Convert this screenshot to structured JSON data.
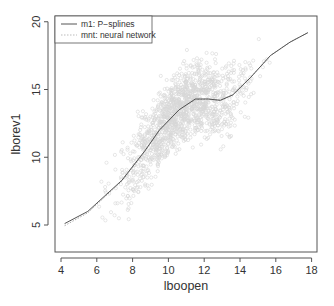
{
  "chart_data": {
    "type": "scatter",
    "title": "",
    "xlabel": "lboopen",
    "ylabel": "lborev1",
    "xlim": [
      3.7,
      18.6
    ],
    "ylim": [
      2.9,
      20.2
    ],
    "xticks": [
      4,
      6,
      8,
      10,
      12,
      14,
      16,
      18
    ],
    "yticks": [
      5,
      10,
      15,
      20
    ],
    "xtick_labels": [
      "4",
      "6",
      "8",
      "10",
      "12",
      "14",
      "16",
      "18"
    ],
    "ytick_labels": [
      "5",
      "10",
      "15",
      "20"
    ],
    "grid": false,
    "legend_position": "top-left",
    "legend": [
      {
        "label": "m1: P−splines",
        "style": "solid",
        "color": "#555555"
      },
      {
        "label": "mnt: neural network",
        "style": "dotted",
        "color": "#bbbbbb"
      }
    ],
    "series": [
      {
        "name": "m1: P-splines",
        "type": "line",
        "color": "#555555",
        "x": [
          4.2,
          5.5,
          7.4,
          8.7,
          9.5,
          10.6,
          11.5,
          12.2,
          12.9,
          13.6,
          14.6,
          15.7,
          16.8,
          17.8
        ],
        "y": [
          5.1,
          6.0,
          8.3,
          10.5,
          12.0,
          13.5,
          14.3,
          14.3,
          14.2,
          14.6,
          15.9,
          17.5,
          18.5,
          19.2
        ]
      },
      {
        "name": "mnt: neural network",
        "type": "line",
        "color": "#aaaaaa",
        "x": [
          4.2,
          5.5,
          7.4,
          8.7,
          9.5,
          10.6,
          11.5,
          12.2,
          12.9,
          13.6,
          14.6,
          15.7,
          16.8,
          17.8
        ],
        "y": [
          4.95,
          5.9,
          8.25,
          10.45,
          12.0,
          13.5,
          14.25,
          14.3,
          14.2,
          14.6,
          15.9,
          17.5,
          18.5,
          19.2
        ]
      },
      {
        "name": "observations",
        "type": "scatter",
        "color": "#d0d0d0",
        "description": "dense cloud of light gray open circles following the trend band, roughly ±3 units around the fitted curve",
        "n_approx": 3000
      }
    ]
  },
  "axes": {
    "x_title": "lboopen",
    "y_title": "lborev1"
  }
}
